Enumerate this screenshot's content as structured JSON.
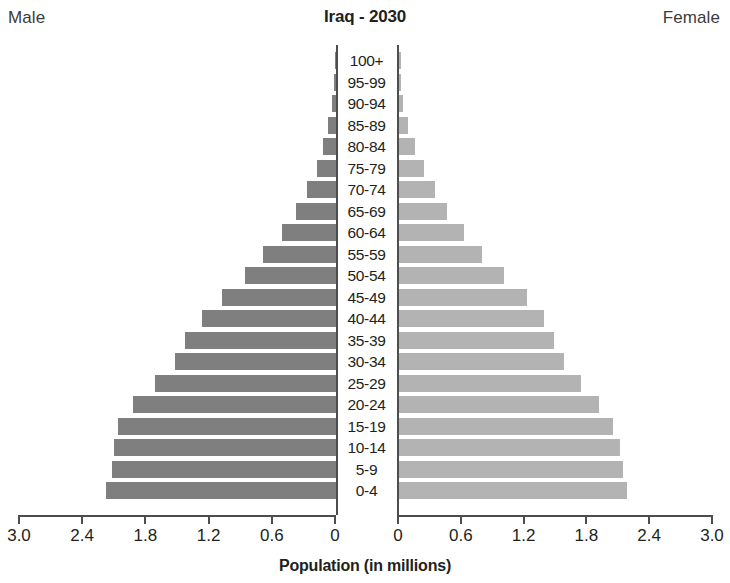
{
  "header": {
    "male_label": "Male",
    "female_label": "Female",
    "title": "Iraq - 2030"
  },
  "axis": {
    "title": "Population (in millions)",
    "left_ticks": [
      "3.0",
      "2.4",
      "1.8",
      "1.2",
      "0.6",
      "0"
    ],
    "right_ticks": [
      "0",
      "0.6",
      "1.2",
      "1.8",
      "2.4",
      "3.0"
    ]
  },
  "colors": {
    "male_bar": "#7f7f7f",
    "female_bar": "#b3b3b3",
    "axis": "#4d4d4d",
    "text": "#231f20",
    "background": "#ffffff"
  },
  "chart_data": {
    "type": "bar",
    "subtype": "population-pyramid",
    "title": "Iraq - 2030",
    "xlabel": "Population (in millions)",
    "ylabel": "",
    "xlim": [
      0,
      3.0
    ],
    "xticks": [
      0,
      0.6,
      1.2,
      1.8,
      2.4,
      3.0
    ],
    "grid": false,
    "legend": "none",
    "orientation": "horizontal",
    "categories": [
      "100+",
      "95-99",
      "90-94",
      "85-89",
      "80-84",
      "75-79",
      "70-74",
      "65-69",
      "60-64",
      "55-59",
      "50-54",
      "45-49",
      "40-44",
      "35-39",
      "30-34",
      "25-29",
      "20-24",
      "15-19",
      "10-14",
      "5-9",
      "0-4"
    ],
    "series": [
      {
        "name": "Male",
        "side": "left",
        "color": "#7f7f7f",
        "values": [
          0.005,
          0.015,
          0.035,
          0.075,
          0.12,
          0.18,
          0.28,
          0.38,
          0.51,
          0.7,
          0.87,
          1.09,
          1.28,
          1.44,
          1.53,
          1.72,
          1.93,
          2.08,
          2.11,
          2.13,
          2.19
        ]
      },
      {
        "name": "Female",
        "side": "right",
        "color": "#b3b3b3",
        "values": [
          0.005,
          0.018,
          0.042,
          0.085,
          0.15,
          0.24,
          0.34,
          0.46,
          0.62,
          0.79,
          1.0,
          1.22,
          1.38,
          1.48,
          1.57,
          1.73,
          1.9,
          2.04,
          2.1,
          2.13,
          2.17
        ]
      }
    ]
  }
}
